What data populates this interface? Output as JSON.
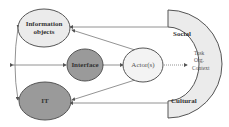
{
  "diagram": {
    "nodes": {
      "information_objects": {
        "line1": "Information",
        "line2": "objects"
      },
      "interface": {
        "label": "Interface"
      },
      "actors": {
        "label": "Actor(s)"
      },
      "it": {
        "label": "IT"
      },
      "context": {
        "social": "Social",
        "cultural": "Cultural",
        "task": "Task",
        "org": "Org.",
        "context": "Context"
      }
    },
    "colors": {
      "light_fill": "#ebebeb",
      "dark_fill": "#9a9a9a",
      "stroke": "#555555",
      "line": "#777777"
    }
  }
}
